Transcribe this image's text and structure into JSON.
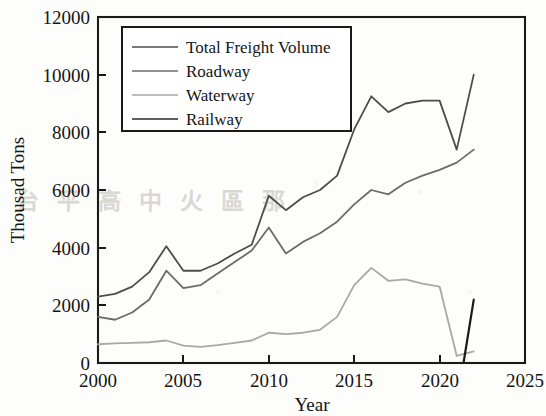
{
  "chart_data": {
    "type": "line",
    "title": "",
    "xlabel": "Year",
    "ylabel": "Thousad Tons",
    "xlim": [
      2000,
      2025
    ],
    "ylim": [
      0,
      12000
    ],
    "xticks": [
      2000,
      2005,
      2010,
      2015,
      2020,
      2025
    ],
    "yticks": [
      0,
      2000,
      4000,
      6000,
      8000,
      10000,
      12000
    ],
    "xtick_labels": [
      "2000",
      "2005",
      "2010",
      "2015",
      "2020",
      "2025"
    ],
    "ytick_labels": [
      "0",
      "2000",
      "4000",
      "6000",
      "8000",
      "10000",
      "12000"
    ],
    "grid": false,
    "legend_position": "upper left",
    "x": [
      2000,
      2001,
      2002,
      2003,
      2004,
      2005,
      2006,
      2007,
      2008,
      2009,
      2010,
      2011,
      2012,
      2013,
      2014,
      2015,
      2016,
      2017,
      2018,
      2019,
      2020,
      2021,
      2022
    ],
    "series": [
      {
        "name": "Total Freight Volume",
        "color": "#4d4d4d",
        "style": "solid",
        "values": [
          2300,
          2400,
          2650,
          3150,
          4050,
          3200,
          3200,
          3450,
          3800,
          4100,
          5800,
          5300,
          5750,
          6000,
          6500,
          8100,
          9250,
          8700,
          9000,
          9100,
          9100,
          7400,
          10000
        ]
      },
      {
        "name": "Roadway",
        "color": "#6b6b6b",
        "style": "solid",
        "values": [
          1600,
          1500,
          1750,
          2200,
          3200,
          2600,
          2700,
          3100,
          3500,
          3900,
          4700,
          3800,
          4200,
          4500,
          4900,
          5500,
          6000,
          5850,
          6250,
          6500,
          6700,
          6950,
          7400
        ]
      },
      {
        "name": "Waterway",
        "color": "#a8a8a8",
        "style": "solid",
        "values": [
          650,
          680,
          700,
          720,
          780,
          600,
          560,
          620,
          700,
          780,
          1050,
          1000,
          1050,
          1150,
          1600,
          2700,
          3300,
          2850,
          2900,
          2750,
          2650,
          250,
          400
        ]
      },
      {
        "name": "Railway",
        "color": "#1a1a1a",
        "style": "solid",
        "segment_only": true,
        "segment_x": [
          2021.4,
          2022
        ],
        "segment_values": [
          0,
          2200
        ],
        "values": [
          null,
          null,
          null,
          null,
          null,
          null,
          null,
          null,
          null,
          null,
          null,
          null,
          null,
          null,
          null,
          null,
          null,
          null,
          null,
          null,
          null,
          0,
          2200
        ]
      }
    ]
  },
  "legend": {
    "entries": [
      {
        "label": "Total Freight Volume"
      },
      {
        "label": "Roadway"
      },
      {
        "label": "Waterway"
      },
      {
        "label": "Railway"
      }
    ]
  },
  "axes": {
    "x_title": "Year",
    "y_title": "Thousad Tons"
  },
  "ghost": {
    "row": "台 平 高 中 火 區 那"
  }
}
